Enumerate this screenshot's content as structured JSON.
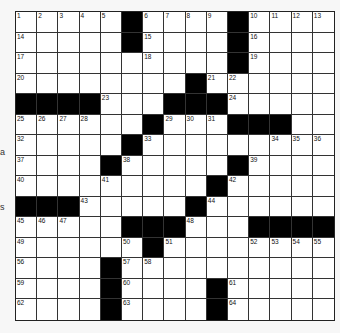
{
  "puzzle": {
    "rows": 15,
    "cols": 15,
    "layout": [
      "#####.####.####",
      "#####.####.####",
      "##########.####",
      "########.######",
      "....###...#####",
      "######.###...##",
      "#####.#########",
      "####.#####.####",
      "#########.#####",
      "...#####.######",
      "#####...###....",
      "######.########",
      "####.##########",
      "####.####.#####",
      "####.####.#####"
    ],
    "numbers": [
      {
        "r": 0,
        "c": 0,
        "n": "1"
      },
      {
        "r": 0,
        "c": 1,
        "n": "2"
      },
      {
        "r": 0,
        "c": 2,
        "n": "3"
      },
      {
        "r": 0,
        "c": 3,
        "n": "4"
      },
      {
        "r": 0,
        "c": 4,
        "n": "5"
      },
      {
        "r": 0,
        "c": 6,
        "n": "6"
      },
      {
        "r": 0,
        "c": 7,
        "n": "7"
      },
      {
        "r": 0,
        "c": 8,
        "n": "8"
      },
      {
        "r": 0,
        "c": 9,
        "n": "9"
      },
      {
        "r": 0,
        "c": 11,
        "n": "10"
      },
      {
        "r": 0,
        "c": 12,
        "n": "11"
      },
      {
        "r": 0,
        "c": 13,
        "n": "12"
      },
      {
        "r": 0,
        "c": 14,
        "n": "13"
      },
      {
        "r": 1,
        "c": 0,
        "n": "14"
      },
      {
        "r": 1,
        "c": 6,
        "n": "15"
      },
      {
        "r": 1,
        "c": 11,
        "n": "16"
      },
      {
        "r": 2,
        "c": 0,
        "n": "17"
      },
      {
        "r": 2,
        "c": 6,
        "n": "18"
      },
      {
        "r": 2,
        "c": 11,
        "n": "19"
      },
      {
        "r": 3,
        "c": 0,
        "n": "20"
      },
      {
        "r": 3,
        "c": 9,
        "n": "21"
      },
      {
        "r": 3,
        "c": 10,
        "n": "22"
      },
      {
        "r": 4,
        "c": 4,
        "n": "23"
      },
      {
        "r": 4,
        "c": 10,
        "n": "24"
      },
      {
        "r": 5,
        "c": 0,
        "n": "25"
      },
      {
        "r": 5,
        "c": 1,
        "n": "26"
      },
      {
        "r": 5,
        "c": 2,
        "n": "27"
      },
      {
        "r": 5,
        "c": 3,
        "n": "28"
      },
      {
        "r": 5,
        "c": 7,
        "n": "29"
      },
      {
        "r": 5,
        "c": 8,
        "n": "30"
      },
      {
        "r": 5,
        "c": 9,
        "n": "31"
      },
      {
        "r": 6,
        "c": 0,
        "n": "32"
      },
      {
        "r": 6,
        "c": 6,
        "n": "33"
      },
      {
        "r": 6,
        "c": 12,
        "n": "34"
      },
      {
        "r": 6,
        "c": 13,
        "n": "35"
      },
      {
        "r": 6,
        "c": 14,
        "n": "36"
      },
      {
        "r": 7,
        "c": 0,
        "n": "37"
      },
      {
        "r": 7,
        "c": 5,
        "n": "38"
      },
      {
        "r": 7,
        "c": 11,
        "n": "39"
      },
      {
        "r": 8,
        "c": 0,
        "n": "40"
      },
      {
        "r": 8,
        "c": 4,
        "n": "41"
      },
      {
        "r": 8,
        "c": 10,
        "n": "42"
      },
      {
        "r": 9,
        "c": 3,
        "n": "43"
      },
      {
        "r": 9,
        "c": 9,
        "n": "44"
      },
      {
        "r": 10,
        "c": 0,
        "n": "45"
      },
      {
        "r": 10,
        "c": 1,
        "n": "46"
      },
      {
        "r": 10,
        "c": 2,
        "n": "47"
      },
      {
        "r": 10,
        "c": 8,
        "n": "48"
      },
      {
        "r": 11,
        "c": 0,
        "n": "49"
      },
      {
        "r": 11,
        "c": 5,
        "n": "50"
      },
      {
        "r": 11,
        "c": 7,
        "n": "51"
      },
      {
        "r": 11,
        "c": 11,
        "n": "52"
      },
      {
        "r": 11,
        "c": 12,
        "n": "53"
      },
      {
        "r": 11,
        "c": 13,
        "n": "54"
      },
      {
        "r": 11,
        "c": 14,
        "n": "55"
      },
      {
        "r": 12,
        "c": 0,
        "n": "56"
      },
      {
        "r": 12,
        "c": 5,
        "n": "57"
      },
      {
        "r": 12,
        "c": 6,
        "n": "58"
      },
      {
        "r": 13,
        "c": 0,
        "n": "59"
      },
      {
        "r": 13,
        "c": 5,
        "n": "60"
      },
      {
        "r": 13,
        "c": 10,
        "n": "61"
      },
      {
        "r": 14,
        "c": 0,
        "n": "62"
      },
      {
        "r": 14,
        "c": 5,
        "n": "63"
      },
      {
        "r": 14,
        "c": 10,
        "n": "64"
      }
    ]
  },
  "margin_marks": [
    {
      "text": "a",
      "top": 148
    },
    {
      "text": "s",
      "top": 203
    }
  ],
  "colors": {
    "black_square": "#000000",
    "white_square": "#ffffff",
    "grid_line": "#333333"
  }
}
